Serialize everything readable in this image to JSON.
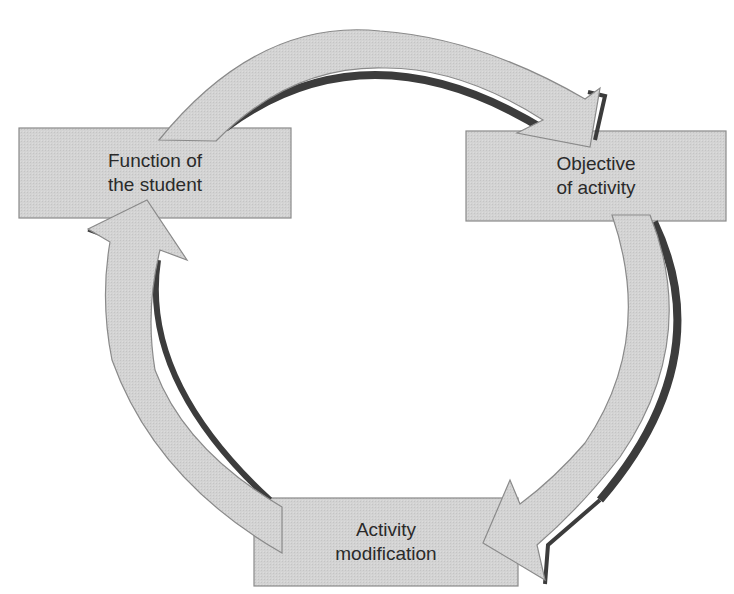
{
  "diagram": {
    "type": "cycle",
    "colors": {
      "fill": "#d2d2d2",
      "stroke": "#8a8a8a",
      "shadow": "#3c3c3c",
      "text": "#2a2a2a",
      "background": "#ffffff"
    },
    "nodes": [
      {
        "id": "function-of-student",
        "line1": "Function of",
        "line2": "the student"
      },
      {
        "id": "objective-of-activity",
        "line1": "Objective",
        "line2": "of activity"
      },
      {
        "id": "activity-modification",
        "line1": "Activity",
        "line2": "modification"
      }
    ],
    "edges": [
      {
        "from": "function-of-student",
        "to": "objective-of-activity",
        "direction": "clockwise"
      },
      {
        "from": "objective-of-activity",
        "to": "activity-modification",
        "direction": "clockwise"
      },
      {
        "from": "activity-modification",
        "to": "function-of-student",
        "direction": "clockwise"
      }
    ]
  }
}
